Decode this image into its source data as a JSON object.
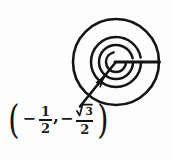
{
  "figure": {
    "kind": "hand-drawn-spiral-diagram",
    "stroke_color": "#141414",
    "background_color": "#fdfdfd",
    "center": {
      "x": 116,
      "y": 62
    },
    "outer_radius": 43,
    "initial_ray": {
      "name": "initial-side-ray",
      "angle_degrees": 0,
      "from": {
        "x": 116,
        "y": 62
      },
      "to": {
        "x": 159,
        "y": 62
      }
    },
    "terminal_ray": {
      "name": "terminal-side-ray",
      "angle_degrees": 240,
      "from": {
        "x": 116,
        "y": 62
      },
      "to": {
        "x": 80,
        "y": 106
      },
      "arrowhead_at": "center"
    },
    "spiral": {
      "turns": 2.75,
      "start_radius": 5,
      "end_radius": 43,
      "direction": "counterclockwise"
    },
    "inner_arc_radii": [
      10,
      17,
      25
    ]
  },
  "coordinate_label": {
    "name": "point-coordinates",
    "open_paren": "(",
    "close_paren": ")",
    "comma": ",",
    "x_sign": "−",
    "x_numerator": "1",
    "x_denominator": "2",
    "y_sign": "−",
    "y_radicand": "3",
    "y_denominator": "2",
    "plain_text": "(− 1/2 , − √3/2)"
  }
}
